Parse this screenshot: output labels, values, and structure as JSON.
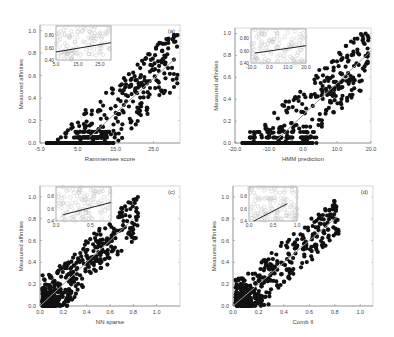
{
  "figure": {
    "panels": [
      {
        "id": "a",
        "label": "(a)",
        "xlabel": "Rammensee score",
        "ylabel": "Measured affinities",
        "xticks": [
          "-5.0",
          "5.0",
          "15.0",
          "25.0"
        ],
        "yticks": [
          "0.0",
          "0.2",
          "0.4",
          "0.6",
          "0.8",
          "1.0"
        ],
        "inset": {
          "xticks": [
            "5.0",
            "15.0",
            "25.0"
          ],
          "yticks": [
            "0.40",
            "0.60",
            "0.80"
          ]
        }
      },
      {
        "id": "b",
        "label": "(b)",
        "xlabel": "HMM prediction",
        "ylabel": "Measured affinities",
        "xticks": [
          "-20.0",
          "-10.0",
          "0.0",
          "10.0",
          "20.0"
        ],
        "yticks": [
          "0.0",
          "0.2",
          "0.4",
          "0.6",
          "0.8",
          "1.0"
        ],
        "inset": {
          "xticks": [
            "-10.0",
            "0.0",
            "10.0",
            "20.0"
          ],
          "yticks": [
            "0.40",
            "0.60",
            "0.80"
          ]
        }
      },
      {
        "id": "c",
        "label": "(c)",
        "xlabel": "NN sparse",
        "ylabel": "Measured affinities",
        "xticks": [
          "0.0",
          "0.2",
          "0.4",
          "0.6",
          "0.8",
          "1.0"
        ],
        "yticks": [
          "0.0",
          "0.2",
          "0.4",
          "0.6",
          "0.8",
          "1.0"
        ],
        "inset": {
          "xticks": [
            "0.0",
            "0.5"
          ],
          "yticks": [
            "0.4",
            "0.6",
            "0.8"
          ]
        }
      },
      {
        "id": "d",
        "label": "(d)",
        "xlabel": "Comb II",
        "ylabel": "Measured affinities",
        "xticks": [
          "0.0",
          "0.2",
          "0.4",
          "0.6",
          "0.8",
          "1.0"
        ],
        "yticks": [
          "0.0",
          "0.2",
          "0.4",
          "0.6",
          "0.8",
          "1.0"
        ],
        "inset": {
          "xticks": [
            "0.0",
            "0.5",
            "1.0"
          ],
          "yticks": [
            "0.4",
            "0.6",
            "0.8"
          ]
        }
      }
    ]
  },
  "chart_data": [
    {
      "type": "scatter",
      "title": "(a)",
      "xlabel": "Rammensee score",
      "ylabel": "Measured affinities",
      "xlim": [
        -5,
        32
      ],
      "ylim": [
        0,
        1.05
      ],
      "trend_line": {
        "x": [
          8,
          31
        ],
        "y": [
          0.05,
          0.76
        ]
      },
      "description": "Dense cluster near x 8-15, y 0-0.15; broad spread up to y 1.0 at higher scores",
      "inset": {
        "type": "scatter",
        "xlim": [
          5,
          30
        ],
        "ylim": [
          0.4,
          0.95
        ],
        "trend_line": {
          "x": [
            5,
            30
          ],
          "y": [
            0.53,
            0.68
          ]
        }
      }
    },
    {
      "type": "scatter",
      "title": "(b)",
      "xlabel": "HMM prediction",
      "ylabel": "Measured affinities",
      "xlim": [
        -20,
        20
      ],
      "ylim": [
        0,
        1.05
      ],
      "trend_line": {
        "x": [
          -8,
          20
        ],
        "y": [
          0.02,
          0.84
        ]
      },
      "description": "Many points at y=0 from x -20 to 0; upward trend to ~0.9 near x 10-20",
      "inset": {
        "type": "scatter",
        "xlim": [
          -10,
          20
        ],
        "ylim": [
          0.4,
          0.95
        ],
        "trend_line": {
          "x": [
            -8,
            20
          ],
          "y": [
            0.56,
            0.68
          ]
        }
      }
    },
    {
      "type": "scatter",
      "title": "(c)",
      "xlabel": "NN sparse",
      "ylabel": "Measured affinities",
      "xlim": [
        0,
        1.2
      ],
      "ylim": [
        0,
        1.1
      ],
      "trend_line": {
        "x": [
          0,
          0.8
        ],
        "y": [
          0.0,
          0.8
        ]
      },
      "description": "Dense cluster near origin; points spread along diagonal up to ~0.85",
      "inset": {
        "type": "scatter",
        "xlim": [
          0,
          0.8
        ],
        "ylim": [
          0.4,
          0.95
        ],
        "trend_line": {
          "x": [
            0.1,
            0.8
          ],
          "y": [
            0.5,
            0.7
          ]
        }
      }
    },
    {
      "type": "scatter",
      "title": "(d)",
      "xlabel": "Comb II",
      "ylabel": "Measured affinities",
      "xlim": [
        0,
        1.1
      ],
      "ylim": [
        0,
        1.1
      ],
      "trend_line": {
        "x": [
          0,
          0.82
        ],
        "y": [
          0.0,
          0.82
        ]
      },
      "description": "Dense cluster near origin; points along diagonal up to ~0.95",
      "inset": {
        "type": "scatter",
        "xlim": [
          0,
          1.0
        ],
        "ylim": [
          0.4,
          0.95
        ],
        "trend_line": {
          "x": [
            0.1,
            0.8
          ],
          "y": [
            0.4,
            0.68
          ]
        }
      }
    }
  ]
}
